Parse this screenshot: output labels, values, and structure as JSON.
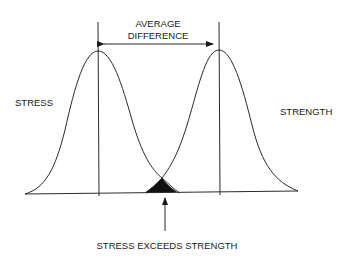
{
  "diagram": {
    "title": "",
    "labels": {
      "average_line1": "AVERAGE",
      "average_line2": "DIFFERENCE",
      "stress": "STRESS",
      "strength": "STRENGTH",
      "overlap": "STRESS EXCEEDS STRENGTH"
    },
    "colors": {
      "stroke": "#2a2a2a",
      "overlap_fill": "#111111",
      "background": "#ffffff"
    },
    "distributions": [
      {
        "name": "stress",
        "mean_x": 98,
        "peak_y": 51
      },
      {
        "name": "strength",
        "mean_x": 219,
        "peak_y": 50
      }
    ],
    "overlap_region": {
      "intersection_x": 162,
      "intersection_y": 178,
      "base_left_x": 145,
      "base_right_x": 177
    }
  }
}
